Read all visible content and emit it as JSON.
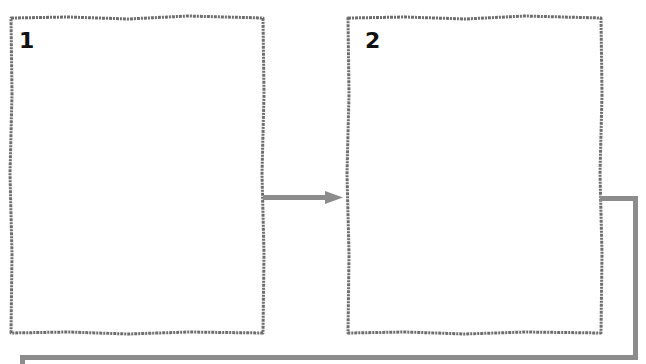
{
  "diagram": {
    "frames": [
      {
        "id": "1",
        "label": "1"
      },
      {
        "id": "2",
        "label": "2"
      }
    ],
    "connectors": [
      {
        "from": "1",
        "to": "2",
        "type": "arrow"
      },
      {
        "from": "2",
        "to": "loop-back",
        "type": "elbow-line"
      }
    ],
    "colors": {
      "border": "#6e6e6e",
      "connector": "#8c8c8c",
      "label": "#111111"
    }
  }
}
